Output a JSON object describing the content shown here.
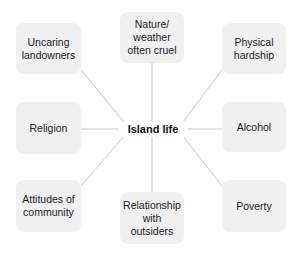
{
  "diagram": {
    "type": "mind-map",
    "center": {
      "label": "Island life"
    },
    "line_color": "#c8c8c8",
    "node_fill": "#f0f0f0",
    "nodes": [
      {
        "id": "uncaring-landowners",
        "label": "Uncaring\nlandowners"
      },
      {
        "id": "nature-weather",
        "label": "Nature/\nweather\noften cruel"
      },
      {
        "id": "physical-hardship",
        "label": "Physical\nhardship"
      },
      {
        "id": "religion",
        "label": "Religion"
      },
      {
        "id": "alcohol",
        "label": "Alcohol"
      },
      {
        "id": "attitudes-of-community",
        "label": "Attitudes of\ncommunity"
      },
      {
        "id": "relationship-with-outsiders",
        "label": "Relationship\nwith\noutsiders"
      },
      {
        "id": "poverty",
        "label": "Poverty"
      }
    ]
  }
}
